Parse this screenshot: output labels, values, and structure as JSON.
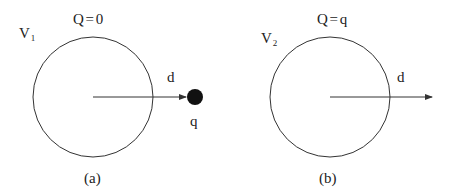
{
  "panels": [
    {
      "id": "a",
      "caption": "(a)",
      "volume_label": "V",
      "volume_subscript": "1",
      "charge_label": "Q = 0",
      "distance_label": "d",
      "point_charge_label": "q",
      "has_point_charge": true
    },
    {
      "id": "b",
      "caption": "(b)",
      "volume_label": "V",
      "volume_subscript": "2",
      "charge_label": "Q = q",
      "distance_label": "d",
      "has_point_charge": false
    }
  ],
  "colors": {
    "stroke": "#333333",
    "point_charge": "#111111",
    "background": "#ffffff"
  }
}
